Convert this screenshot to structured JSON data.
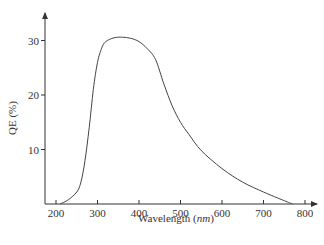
{
  "chart_data": {
    "type": "line",
    "title": "",
    "xlabel": "Wavelength (nm)",
    "xlabel_main": "Wavelength (",
    "xlabel_unit": "nm",
    "xlabel_close": ")",
    "ylabel": "QE (%)",
    "xlim": [
      180,
      830
    ],
    "ylim": [
      0,
      35
    ],
    "grid": false,
    "legend": null,
    "x_ticks": [
      200,
      300,
      400,
      500,
      600,
      700,
      800
    ],
    "x_tick_labels": [
      "200",
      "300",
      "400",
      "500",
      "600",
      "700",
      "800"
    ],
    "y_ticks": [
      10,
      20,
      30
    ],
    "y_tick_labels": [
      "10",
      "20",
      "30"
    ],
    "series": [
      {
        "name": "QE",
        "x": [
          210,
          230,
          250,
          260,
          270,
          280,
          290,
          300,
          310,
          320,
          340,
          360,
          380,
          400,
          420,
          440,
          460,
          480,
          500,
          520,
          550,
          600,
          650,
          700,
          750,
          770
        ],
        "y": [
          0.0,
          0.8,
          2.2,
          4.0,
          8.0,
          14.0,
          21.0,
          26.0,
          28.6,
          29.8,
          30.5,
          30.6,
          30.4,
          29.8,
          28.5,
          26.5,
          22.0,
          18.0,
          15.0,
          12.8,
          9.8,
          6.5,
          4.0,
          2.2,
          0.6,
          0.0
        ]
      }
    ]
  }
}
